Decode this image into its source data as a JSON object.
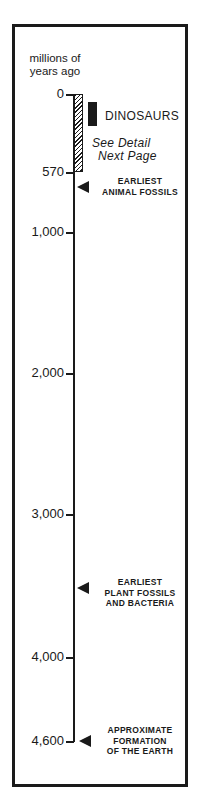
{
  "axis": {
    "label_line1": "millions of",
    "label_line2": "years ago",
    "ticks": [
      {
        "label": "0",
        "value": 0
      },
      {
        "label": "570",
        "value": 570
      },
      {
        "label": "1,000",
        "value": 1000
      },
      {
        "label": "2,000",
        "value": 2000
      },
      {
        "label": "3,000",
        "value": 3000
      },
      {
        "label": "4,000",
        "value": 4000
      },
      {
        "label": "4,600",
        "value": 4600
      }
    ]
  },
  "highlight_range": {
    "from": 0,
    "to": 570,
    "note_line1": "See Detail",
    "note_line2": "Next Page"
  },
  "dinosaurs": {
    "label": "DINOSAURS"
  },
  "events": [
    {
      "line1": "EARLIEST",
      "line2": "ANIMAL FOSSILS",
      "line3": "",
      "value": 600
    },
    {
      "line1": "EARLIEST",
      "line2": "PLANT FOSSILS",
      "line3": "AND BACTERIA",
      "value": 3500
    },
    {
      "line1": "APPROXIMATE",
      "line2": "FORMATION",
      "line3": "OF THE EARTH",
      "value": 4600
    }
  ],
  "colors": {
    "ink": "#1a1a1a",
    "background": "#ffffff"
  }
}
